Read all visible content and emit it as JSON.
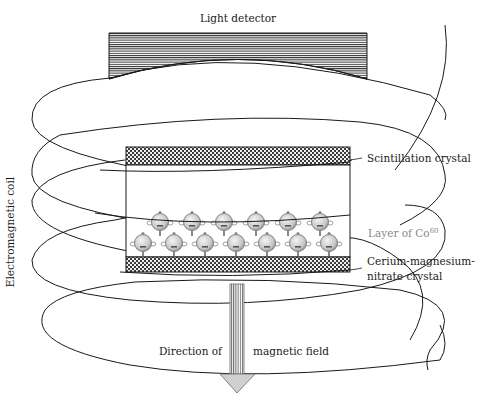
{
  "diagram": {
    "labels": {
      "light_detector": "Light detector",
      "electromagnetic_coil": "Electromagnetic coil",
      "scintillation_crystal": "Scintillation crystal",
      "layer_co": "Layer of Co",
      "layer_co_superscript": "60",
      "cerium_line1": "Cerium-magnesium-",
      "cerium_line2": "nitrate crystal",
      "direction_of": "Direction of",
      "magnetic_field": "magnetic field"
    },
    "atoms": {
      "top_row_count": 6,
      "bottom_row_count": 7
    },
    "colors": {
      "line": "#1a1a1a",
      "atom_fill": "#c8c8c8",
      "gray_label": "#8a8a8a",
      "arrow_fill": "#d0d0d0"
    }
  }
}
